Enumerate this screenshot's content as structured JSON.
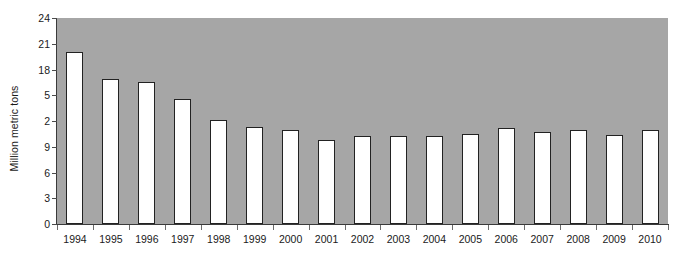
{
  "chart_data": {
    "type": "bar",
    "title": "",
    "subtitle": "",
    "xlabel": "",
    "ylabel": "Million metric tons",
    "categories": [
      "1994",
      "1995",
      "1996",
      "1997",
      "1998",
      "1999",
      "2000",
      "2001",
      "2002",
      "2003",
      "2004",
      "2005",
      "2006",
      "2007",
      "2008",
      "2009",
      "2010"
    ],
    "values": [
      20.0,
      16.9,
      16.5,
      14.6,
      12.1,
      11.3,
      11.0,
      9.8,
      10.2,
      10.3,
      10.2,
      10.5,
      11.2,
      10.7,
      11.0,
      10.4,
      11.0
    ],
    "ylim": [
      0,
      24
    ],
    "y_ticks": [
      0,
      3,
      6,
      9,
      12,
      15,
      18,
      21,
      24
    ],
    "y_tick_labels": [
      "0",
      "3",
      "6",
      "9",
      "2",
      "5",
      "18",
      "21",
      "24"
    ],
    "grid": false,
    "legend": null,
    "legend_position": "none",
    "bar_fill_color": "#ffffff",
    "bar_edge_color": "#222222",
    "plot_background_color": "#a6a6a6",
    "figure_background_color": "#ffffff",
    "axis_color": "#3a3a3a",
    "text_color": "#1a1a1a"
  }
}
